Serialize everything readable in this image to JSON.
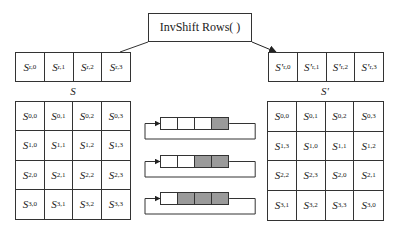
{
  "title": "InvShift Rows(  )",
  "input_row": {
    "label_base": "S",
    "cells": [
      {
        "base": "S",
        "sub": "r,0"
      },
      {
        "base": "S",
        "sub": "r,1"
      },
      {
        "base": "S",
        "sub": "r,2"
      },
      {
        "base": "S",
        "sub": "r,3"
      }
    ]
  },
  "output_row": {
    "cells": [
      {
        "base": "S'",
        "sub": "r,0"
      },
      {
        "base": "S'",
        "sub": "r,1"
      },
      {
        "base": "S'",
        "sub": "r,2"
      },
      {
        "base": "S'",
        "sub": "r,3"
      }
    ]
  },
  "left_matrix": {
    "label": "S",
    "cells": [
      [
        "0,0",
        "0,1",
        "0,2",
        "0,3"
      ],
      [
        "1,0",
        "1,1",
        "1,2",
        "1,3"
      ],
      [
        "2,0",
        "2,1",
        "2,2",
        "2,3"
      ],
      [
        "3,0",
        "3,1",
        "3,2",
        "3,3"
      ]
    ]
  },
  "right_matrix": {
    "label": "S'",
    "cells": [
      [
        "0,0",
        "0,1",
        "0,2",
        "0,3"
      ],
      [
        "1,3",
        "1,0",
        "1,1",
        "1,2"
      ],
      [
        "2,2",
        "2,3",
        "2,0",
        "2,1"
      ],
      [
        "3,1",
        "3,2",
        "3,3",
        "3,0"
      ]
    ]
  },
  "shift_diagrams": [
    {
      "shaded": [
        false,
        false,
        false,
        true
      ]
    },
    {
      "shaded": [
        false,
        false,
        true,
        true
      ]
    },
    {
      "shaded": [
        false,
        true,
        true,
        true
      ]
    }
  ],
  "colors": {
    "line": "#333333",
    "shade": "#9a9a9a",
    "background": "#ffffff"
  }
}
